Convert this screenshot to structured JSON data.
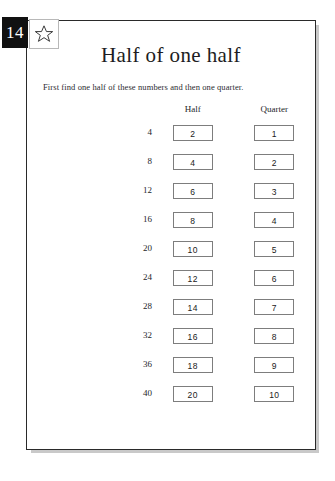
{
  "page_number": "14",
  "star_icon": "star-icon",
  "title": "Half of one half",
  "instruction": "First find one half of these numbers and then one quarter.",
  "table": {
    "headers": {
      "source": "",
      "half": "Half",
      "quarter": "Quarter"
    },
    "rows": [
      {
        "source": "4",
        "half": "2",
        "quarter": "1"
      },
      {
        "source": "8",
        "half": "4",
        "quarter": "2"
      },
      {
        "source": "12",
        "half": "6",
        "quarter": "3"
      },
      {
        "source": "16",
        "half": "8",
        "quarter": "4"
      },
      {
        "source": "20",
        "half": "10",
        "quarter": "5"
      },
      {
        "source": "24",
        "half": "12",
        "quarter": "6"
      },
      {
        "source": "28",
        "half": "14",
        "quarter": "7"
      },
      {
        "source": "32",
        "half": "16",
        "quarter": "8"
      },
      {
        "source": "36",
        "half": "18",
        "quarter": "9"
      },
      {
        "source": "40",
        "half": "20",
        "quarter": "10"
      }
    ]
  }
}
